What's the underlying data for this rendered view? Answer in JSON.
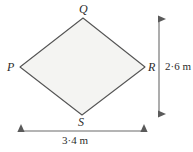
{
  "figure": {
    "type": "rhombus-diagram",
    "shape_name": "rhombus-PQRS",
    "fill_color": "#f4f4f2",
    "stroke_color": "#555555",
    "background_color": "#ffffff",
    "vertices": [
      {
        "label": "Q",
        "position": "top",
        "x": 83,
        "y": 18
      },
      {
        "label": "R",
        "position": "right",
        "x": 145,
        "y": 67
      },
      {
        "label": "S",
        "position": "bottom",
        "x": 82,
        "y": 115
      },
      {
        "label": "P",
        "position": "left",
        "x": 20,
        "y": 67
      }
    ],
    "dimensions": [
      {
        "name": "vertical-diagonal",
        "label": "2·6 m",
        "value": 2.6,
        "unit": "m",
        "orientation": "vertical",
        "from": "Q",
        "to": "S"
      },
      {
        "name": "horizontal-diagonal",
        "label": "3·4 m",
        "value": 3.4,
        "unit": "m",
        "orientation": "horizontal",
        "from": "P",
        "to": "R"
      }
    ]
  }
}
